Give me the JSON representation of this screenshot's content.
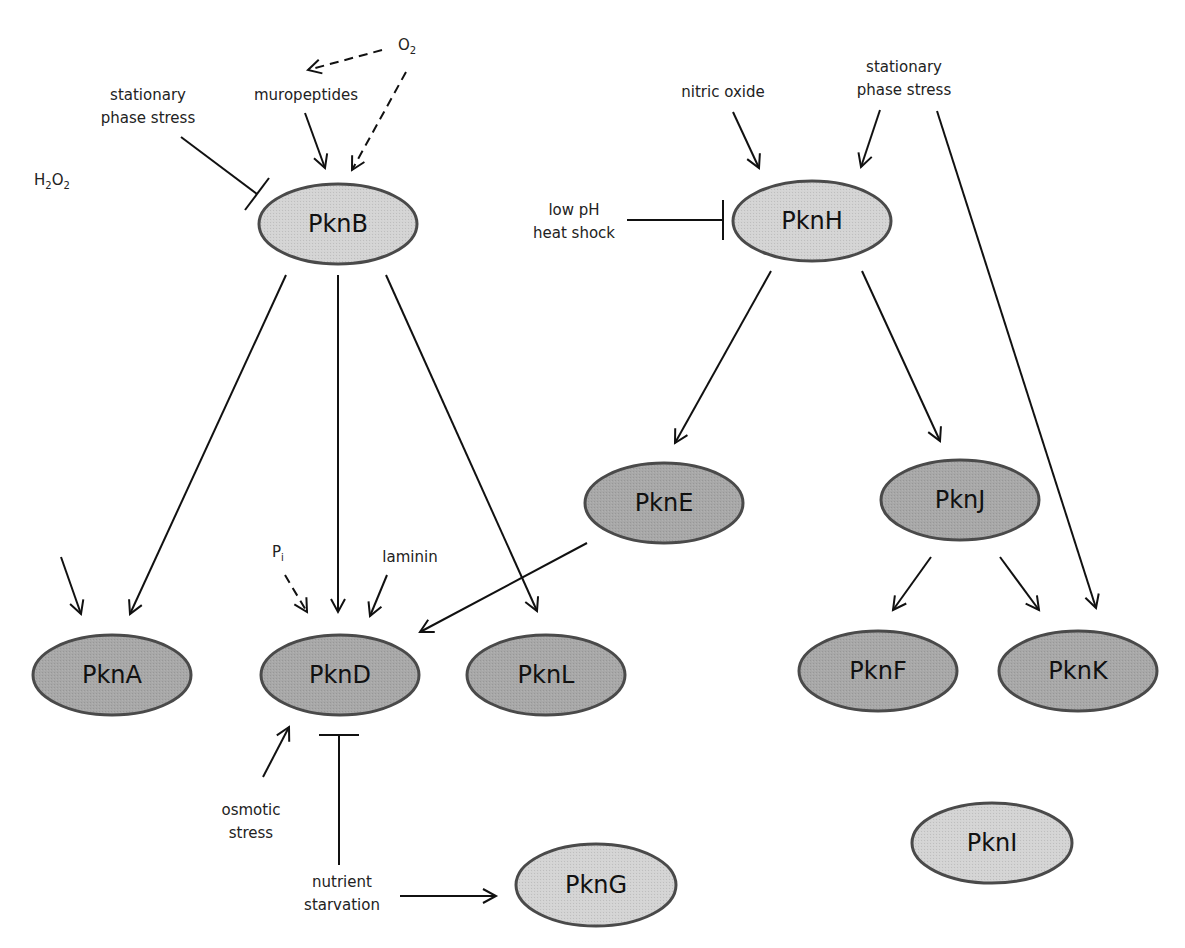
{
  "diagram": {
    "type": "signaling network",
    "colors": {
      "light_fill": "#d4d4d4",
      "dark_fill": "#a8a8a8",
      "stroke": "#4a4a4a",
      "edge": "#111111"
    },
    "nodes": [
      {
        "id": "PknB",
        "label": "PknB",
        "cx": 338,
        "cy": 224,
        "rx": 79,
        "ry": 40,
        "shade": "light"
      },
      {
        "id": "PknH",
        "label": "PknH",
        "cx": 812,
        "cy": 221,
        "rx": 79,
        "ry": 40,
        "shade": "light"
      },
      {
        "id": "PknE",
        "label": "PknE",
        "cx": 664,
        "cy": 503,
        "rx": 79,
        "ry": 40,
        "shade": "dark"
      },
      {
        "id": "PknJ",
        "label": "PknJ",
        "cx": 960,
        "cy": 500,
        "rx": 79,
        "ry": 40,
        "shade": "dark"
      },
      {
        "id": "PknA",
        "label": "PknA",
        "cx": 112,
        "cy": 675,
        "rx": 79,
        "ry": 40,
        "shade": "dark"
      },
      {
        "id": "PknD",
        "label": "PknD",
        "cx": 340,
        "cy": 675,
        "rx": 79,
        "ry": 40,
        "shade": "dark"
      },
      {
        "id": "PknL",
        "label": "PknL",
        "cx": 546,
        "cy": 675,
        "rx": 79,
        "ry": 40,
        "shade": "dark"
      },
      {
        "id": "PknF",
        "label": "PknF",
        "cx": 878,
        "cy": 671,
        "rx": 79,
        "ry": 40,
        "shade": "dark"
      },
      {
        "id": "PknK",
        "label": "PknK",
        "cx": 1078,
        "cy": 671,
        "rx": 79,
        "ry": 40,
        "shade": "dark"
      },
      {
        "id": "PknG",
        "label": "PknG",
        "cx": 596,
        "cy": 885,
        "rx": 80,
        "ry": 41,
        "shade": "light"
      },
      {
        "id": "PknI",
        "label": "PknI",
        "cx": 992,
        "cy": 843,
        "rx": 80,
        "ry": 40,
        "shade": "light"
      }
    ],
    "stimuli": [
      {
        "id": "O2",
        "text": "O",
        "sub": "2",
        "x": 398,
        "y": 50
      },
      {
        "id": "muropeptides",
        "lines": [
          "muropeptides"
        ],
        "x": 306,
        "y": 100
      },
      {
        "id": "stationary-left",
        "lines": [
          "stationary",
          "phase stress"
        ],
        "x": 148,
        "y": 100
      },
      {
        "id": "nitric-oxide",
        "lines": [
          "nitric oxide"
        ],
        "x": 723,
        "y": 97
      },
      {
        "id": "stationary-right",
        "lines": [
          "stationary",
          "phase stress"
        ],
        "x": 904,
        "y": 72
      },
      {
        "id": "low-ph-heat",
        "lines": [
          "low pH",
          "heat shock"
        ],
        "x": 574,
        "y": 215
      },
      {
        "id": "H2O2",
        "text": "H",
        "sub": "2",
        "text2": "O",
        "sub2": "2",
        "x": 34,
        "y": 185
      },
      {
        "id": "Pi",
        "text": "P",
        "sub": "i",
        "x": 272,
        "y": 557
      },
      {
        "id": "laminin",
        "lines": [
          "laminin"
        ],
        "x": 410,
        "y": 562
      },
      {
        "id": "osmotic-stress",
        "lines": [
          "osmotic",
          "stress"
        ],
        "x": 251,
        "y": 815
      },
      {
        "id": "nutrient-starvation",
        "lines": [
          "nutrient",
          "starvation"
        ],
        "x": 342,
        "y": 887
      }
    ],
    "edges": [
      {
        "from": "O2",
        "to": "muropeptides",
        "kind": "activate",
        "dashed": true,
        "x1": 382,
        "y1": 50,
        "x2": 308,
        "y2": 70
      },
      {
        "from": "O2",
        "to": "PknB",
        "kind": "activate",
        "dashed": true,
        "x1": 406,
        "y1": 72,
        "x2": 352,
        "y2": 170
      },
      {
        "from": "muropeptides",
        "to": "PknB",
        "kind": "activate",
        "dashed": false,
        "x1": 305,
        "y1": 113,
        "x2": 325,
        "y2": 168
      },
      {
        "from": "stationary-left",
        "to": "PknB",
        "kind": "inhibit",
        "dashed": false,
        "x1": 181,
        "y1": 137,
        "x2": 257,
        "y2": 194
      },
      {
        "from": "nitric-oxide",
        "to": "PknH",
        "kind": "activate",
        "dashed": false,
        "x1": 733,
        "y1": 112,
        "x2": 759,
        "y2": 168
      },
      {
        "from": "stationary-right",
        "to": "PknH",
        "kind": "activate",
        "dashed": false,
        "x1": 880,
        "y1": 110,
        "x2": 861,
        "y2": 167
      },
      {
        "from": "low-ph-heat",
        "to": "PknH",
        "kind": "inhibit",
        "dashed": false,
        "x1": 627,
        "y1": 220,
        "x2": 723,
        "y2": 220
      },
      {
        "from": "stationary-right",
        "to": "PknK",
        "kind": "activate",
        "dashed": false,
        "x1": 937,
        "y1": 111,
        "x2": 1096,
        "y2": 608
      },
      {
        "from": "PknB",
        "to": "PknA",
        "kind": "activate",
        "dashed": false,
        "x1": 286,
        "y1": 275,
        "x2": 130,
        "y2": 614
      },
      {
        "from": "PknB",
        "to": "PknD",
        "kind": "activate",
        "dashed": false,
        "x1": 338,
        "y1": 275,
        "x2": 338,
        "y2": 612
      },
      {
        "from": "PknB",
        "to": "PknL",
        "kind": "activate",
        "dashed": false,
        "x1": 386,
        "y1": 275,
        "x2": 537,
        "y2": 611
      },
      {
        "from": "PknH",
        "to": "PknE",
        "kind": "activate",
        "dashed": false,
        "x1": 771,
        "y1": 271,
        "x2": 675,
        "y2": 443
      },
      {
        "from": "PknH",
        "to": "PknJ",
        "kind": "activate",
        "dashed": false,
        "x1": 862,
        "y1": 271,
        "x2": 940,
        "y2": 441
      },
      {
        "from": "PknE",
        "to": "PknD",
        "kind": "activate",
        "dashed": false,
        "x1": 587,
        "y1": 543,
        "x2": 420,
        "y2": 632
      },
      {
        "from": "PknJ",
        "to": "PknF",
        "kind": "activate",
        "dashed": false,
        "x1": 931,
        "y1": 557,
        "x2": 893,
        "y2": 610
      },
      {
        "from": "PknJ",
        "to": "PknK",
        "kind": "activate",
        "dashed": false,
        "x1": 1000,
        "y1": 557,
        "x2": 1039,
        "y2": 610
      },
      {
        "from": "H2O2",
        "to": "PknA",
        "kind": "activate",
        "dashed": false,
        "x1": 61,
        "y1": 557,
        "x2": 81,
        "y2": 614
      },
      {
        "from": "Pi",
        "to": "PknD",
        "kind": "activate",
        "dashed": true,
        "x1": 285,
        "y1": 575,
        "x2": 307,
        "y2": 612
      },
      {
        "from": "laminin",
        "to": "PknD",
        "kind": "activate",
        "dashed": false,
        "x1": 387,
        "y1": 575,
        "x2": 370,
        "y2": 616
      },
      {
        "from": "osmotic-stress",
        "to": "PknD",
        "kind": "activate",
        "dashed": false,
        "x1": 263,
        "y1": 777,
        "x2": 289,
        "y2": 727
      },
      {
        "from": "nutrient-starvation",
        "to": "PknD",
        "kind": "inhibit",
        "dashed": false,
        "x1": 339,
        "y1": 865,
        "x2": 339,
        "y2": 735
      },
      {
        "from": "nutrient-starvation",
        "to": "PknG",
        "kind": "activate",
        "dashed": false,
        "x1": 400,
        "y1": 896,
        "x2": 496,
        "y2": 896
      }
    ]
  }
}
